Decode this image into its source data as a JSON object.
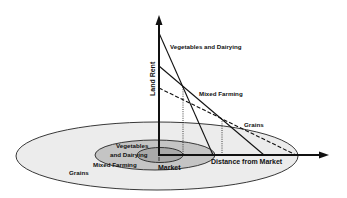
{
  "diagram": {
    "type": "von-thunen-bid-rent",
    "axes": {
      "y_label": "Land Rent",
      "x_label": "Distance from Market"
    },
    "rent_curves": [
      {
        "name": "Vegetables and Dairying",
        "label": "Vegetables and Dairying",
        "style": "solid"
      },
      {
        "name": "Mixed Farming",
        "label": "Mixed Farming",
        "style": "solid"
      },
      {
        "name": "Grains",
        "label": "Grains",
        "style": "dashed"
      }
    ],
    "zones": {
      "inner": {
        "label_line1": "Vegetables",
        "label_line2": "and Dairying",
        "fill": "#a9a9a9"
      },
      "middle": {
        "label": "Mixed Farming",
        "fill": "#c4c4c4"
      },
      "outer": {
        "label": "Grains",
        "fill": "#ececec"
      }
    },
    "center_label": "Market",
    "colors": {
      "line": "#111111",
      "background": "#ffffff"
    }
  }
}
